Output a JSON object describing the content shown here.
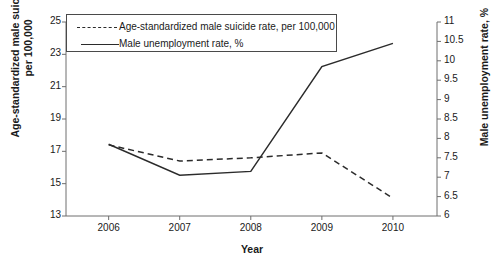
{
  "figure": {
    "top_cut_text": "",
    "xlabel": "Year",
    "ylabel_left_line1": "Age-standardized male suicide rate,",
    "ylabel_left_line2": "per 100,000",
    "ylabel_right": "Male unemployment rate, %",
    "legend": [
      {
        "label": "Age-standardized male suicide rate, per 100,000",
        "style": "dashed",
        "key_name": "legend-key-suicide"
      },
      {
        "label": "Male unemployment rate, %",
        "style": "solid",
        "key_name": "legend-key-unemployment"
      }
    ],
    "colors": {
      "line": "#2b2b2b",
      "axis": "#6e6e6e",
      "background": "#ffffff",
      "text": "#1a1a1a"
    }
  },
  "chart_data": {
    "type": "line",
    "title": "",
    "xlabel": "Year",
    "categories": [
      "2006",
      "2007",
      "2008",
      "2009",
      "2010"
    ],
    "x": [
      2006,
      2007,
      2008,
      2009,
      2010
    ],
    "grid": false,
    "legend_position": "top-left-inside",
    "axes": {
      "left": {
        "label": "Age-standardized male suicide rate, per 100,000",
        "ylim": [
          13,
          25
        ],
        "ticks": [
          13,
          15,
          17,
          19,
          21,
          23,
          25
        ],
        "tick_labels": [
          "13",
          "15",
          "17",
          "19",
          "21",
          "23",
          "25"
        ]
      },
      "right": {
        "label": "Male unemployment rate, %",
        "ylim": [
          6,
          11
        ],
        "ticks": [
          6,
          6.5,
          7,
          7.5,
          8,
          8.5,
          9,
          9.5,
          10,
          10.5,
          11
        ],
        "tick_labels": [
          "6",
          "6.5",
          "7",
          "7.5",
          "8",
          "8.5",
          "9",
          "9.5",
          "10",
          "10.5",
          "11"
        ]
      }
    },
    "series": [
      {
        "name": "Age-standardized male suicide rate, per 100,000",
        "axis": "left",
        "style": "dashed",
        "values": [
          17.4,
          16.4,
          16.6,
          16.9,
          14.1
        ]
      },
      {
        "name": "Male unemployment rate, %",
        "axis": "right",
        "style": "solid",
        "values": [
          7.85,
          7.05,
          7.15,
          9.85,
          10.45
        ]
      }
    ]
  }
}
